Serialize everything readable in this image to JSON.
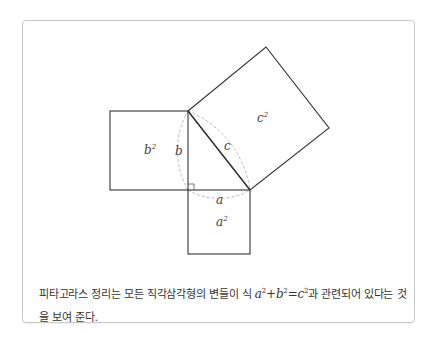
{
  "figure": {
    "labels": {
      "a": "a",
      "b": "b",
      "c": "c",
      "a_squared_base": "a",
      "a_squared_exp": "2",
      "b_squared_base": "b",
      "b_squared_exp": "2",
      "c_squared_base": "c",
      "c_squared_exp": "2"
    },
    "colors": {
      "stroke": "#333333",
      "arc": "#bbbbbb",
      "border": "#c9c9c9"
    }
  },
  "caption": {
    "text_before": "피타고라스 정리는 모든 직각삼각형의 변들이 식 ",
    "eq_a": "a",
    "eq_a_exp": "2",
    "eq_plus": "+",
    "eq_b": "b",
    "eq_b_exp": "2",
    "eq_equals": "=",
    "eq_c": "c",
    "eq_c_exp": "2",
    "text_after": "과 관련되어 있다는 것을 보여 준다."
  }
}
